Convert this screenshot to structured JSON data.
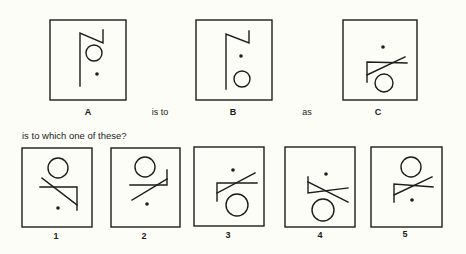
{
  "question": {
    "connector_is_to": "is to",
    "connector_as": "as",
    "prompt": "is to which one of these?"
  },
  "colors": {
    "background": "#fdfdf7",
    "ink": "#1c1c1c"
  },
  "analogy": [
    {
      "label": "A",
      "box": [
        50,
        20,
        76,
        80
      ],
      "shape": "vertical line with diagonal then short upward stroke (Z-hook)",
      "circle": [
        94,
        53,
        8
      ],
      "dot": [
        97,
        74
      ]
    },
    {
      "label": "B",
      "box": [
        196,
        20,
        76,
        80
      ],
      "shape": "same hook as A",
      "circle": [
        242,
        79,
        8
      ],
      "dot": [
        241,
        56
      ]
    },
    {
      "label": "C",
      "box": [
        343,
        20,
        74,
        80
      ],
      "shape": "short vertical, horizontal bar and crossing diagonal",
      "circle": [
        384,
        83,
        9
      ],
      "dot": [
        383,
        47
      ]
    }
  ],
  "options": [
    {
      "label": "1",
      "box": [
        22,
        148,
        70,
        79
      ],
      "circle": [
        58,
        168,
        10
      ],
      "dot": [
        58,
        208
      ]
    },
    {
      "label": "2",
      "box": [
        111,
        148,
        69,
        79
      ],
      "circle": [
        145,
        167,
        10
      ],
      "dot": [
        147,
        204
      ]
    },
    {
      "label": "3",
      "box": [
        194,
        147,
        70,
        79
      ],
      "circle": [
        237,
        205,
        11
      ],
      "dot": [
        233,
        170
      ]
    },
    {
      "label": "4",
      "box": [
        285,
        147,
        70,
        80
      ],
      "circle": [
        323,
        210,
        11
      ],
      "dot": [
        326,
        174
      ]
    },
    {
      "label": "5",
      "box": [
        371,
        147,
        71,
        80
      ],
      "circle": [
        411,
        167,
        10
      ],
      "dot": [
        412,
        200
      ]
    }
  ]
}
